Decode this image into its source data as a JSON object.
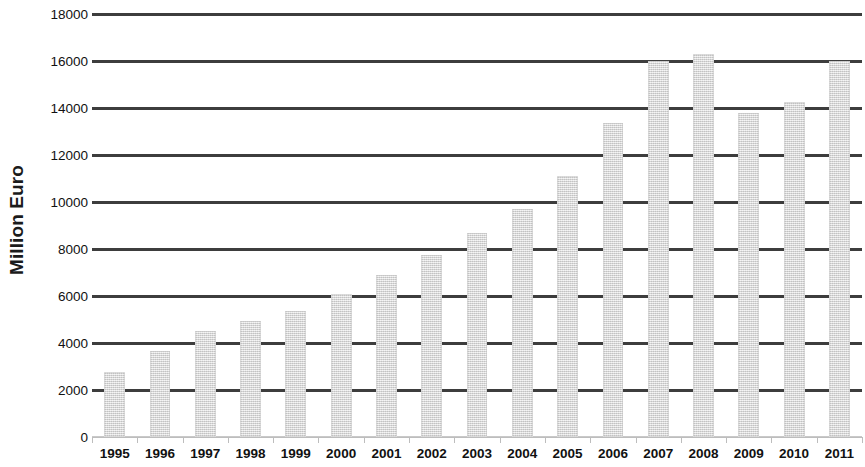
{
  "chart_data": {
    "type": "bar",
    "title": "",
    "subtitle": "",
    "xlabel": "",
    "ylabel": "Million Euro",
    "ylim": [
      0,
      18000
    ],
    "ytick_step": 2000,
    "yticks": [
      18000,
      16000,
      14000,
      12000,
      10000,
      8000,
      6000,
      4000,
      2000,
      0
    ],
    "ytick_labels": [
      "18000",
      "16000",
      "14000",
      "12000",
      "10000",
      "8000",
      "6000",
      "4000",
      "2000",
      "0"
    ],
    "grid": true,
    "grid_axis": "y",
    "legend": false,
    "legend_position": "none",
    "bar_color": "#d9d9d9",
    "gridline_color": "#3d3d3d",
    "axis_color": "#bdbdbd",
    "text_color": "#111111",
    "categories": [
      "1995",
      "1996",
      "1997",
      "1998",
      "1999",
      "2000",
      "2001",
      "2002",
      "2003",
      "2004",
      "2005",
      "2006",
      "2007",
      "2008",
      "2009",
      "2010",
      "2011"
    ],
    "values": [
      2750,
      3650,
      4500,
      4950,
      5350,
      6100,
      6900,
      7750,
      8700,
      9700,
      11100,
      13350,
      16000,
      16300,
      13800,
      14250,
      16000
    ],
    "series": [
      {
        "name": "Million Euro",
        "values": [
          2750,
          3650,
          4500,
          4950,
          5350,
          6100,
          6900,
          7750,
          8700,
          9700,
          11100,
          13350,
          16000,
          16300,
          13800,
          14250,
          16000
        ]
      }
    ]
  }
}
